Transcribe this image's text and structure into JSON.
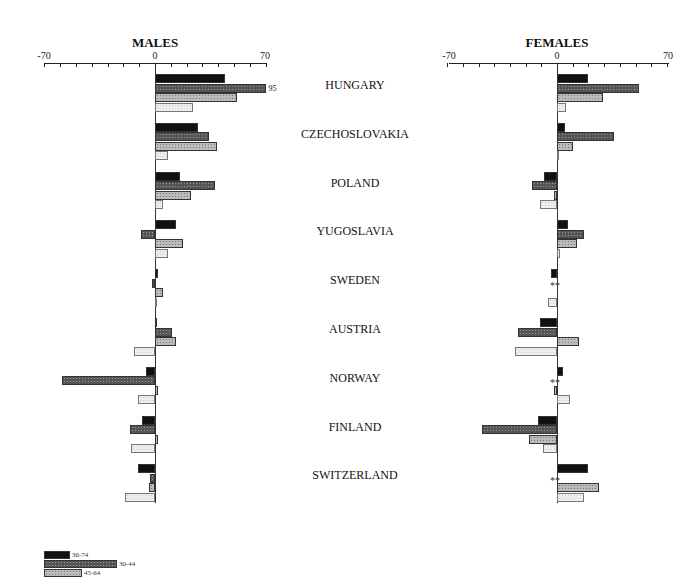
{
  "chart_data": {
    "type": "bar",
    "orientation": "horizontal",
    "panels": [
      {
        "title": "MALES",
        "xlim": [
          -70,
          70
        ],
        "ticks": [
          "-70",
          "0",
          "70"
        ]
      },
      {
        "title": "FEMALES",
        "xlim": [
          -70,
          70
        ],
        "ticks": [
          "-70",
          "0",
          "70"
        ]
      }
    ],
    "categories": [
      "HUNGARY",
      "CZECHOSLOVAKIA",
      "POLAND",
      "YUGOSLAVIA",
      "SWEDEN",
      "AUSTRIA",
      "NORWAY",
      "FINLAND",
      "SWITZERLAND"
    ],
    "series": [
      {
        "name": "30-74",
        "males": [
          44,
          27,
          16,
          13,
          2,
          1,
          -6,
          -8,
          -11
        ],
        "females": [
          20,
          5,
          -8,
          7,
          -4,
          -11,
          4,
          -12,
          20
        ]
      },
      {
        "name": "30-44",
        "males": [
          95,
          34,
          38,
          -9,
          -2,
          11,
          -59,
          -16,
          -3
        ],
        "females": [
          52,
          36,
          -16,
          17,
          null,
          -25,
          null,
          -48,
          null
        ]
      },
      {
        "name": "45-64",
        "males": [
          52,
          39,
          23,
          18,
          5,
          13,
          2,
          2,
          -4
        ],
        "females": [
          29,
          10,
          -2,
          13,
          null,
          14,
          -2,
          -18,
          27
        ]
      },
      {
        "name": "65-74",
        "males": [
          24,
          8,
          5,
          8,
          0,
          -13,
          -11,
          -15,
          -19
        ],
        "females": [
          6,
          0,
          -11,
          2,
          -6,
          -27,
          8,
          -9,
          17
        ]
      }
    ],
    "annotations": [
      {
        "panel": "MALES",
        "category": "HUNGARY",
        "series": "30-44",
        "text": "95"
      },
      {
        "panel": "FEMALES",
        "category": "SWEDEN",
        "text": "**"
      },
      {
        "panel": "FEMALES",
        "category": "NORWAY",
        "text": "**"
      },
      {
        "panel": "FEMALES",
        "category": "SWITZERLAND",
        "text": "**"
      }
    ],
    "legend": [
      "30-74",
      "30-44",
      "45-64"
    ],
    "legend_position": "bottom-left",
    "grid": false
  },
  "labels": {
    "males_title": "MALES",
    "females_title": "FEMALES",
    "tick_neg": "-70",
    "tick_zero": "0",
    "tick_pos": "70",
    "clip_value": "95",
    "star": "**"
  }
}
